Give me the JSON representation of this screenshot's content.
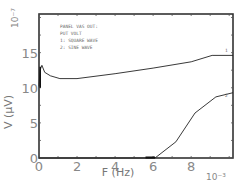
{
  "chart_data": {
    "type": "line",
    "title": "",
    "xlabel": "F (Hz)",
    "ylabel": "V (μV)",
    "x_multiplier": "10⁻³",
    "y_multiplier": "10⁻⁷",
    "xlim": [
      0,
      10.2
    ],
    "ylim": [
      0,
      20.5
    ],
    "x_ticks": [
      "0",
      "2",
      "4",
      "6",
      "8"
    ],
    "y_ticks": [
      "0",
      "5",
      "10",
      "15"
    ],
    "grid": false,
    "legend": {
      "position": "upper-left-inside",
      "lines": [
        "PANEL VAS OUT:",
        "PUT VOLT",
        "1: SQUARE WAVE",
        "2: SINE WAVE"
      ]
    },
    "series": [
      {
        "name": "1: Square wave",
        "label_marker": "1",
        "x": [
          0.0,
          0.05,
          0.15,
          0.3,
          0.6,
          1.1,
          2.0,
          4.0,
          6.0,
          8.0,
          9.1,
          10.2
        ],
        "y": [
          10.2,
          12.5,
          13.2,
          12.2,
          11.7,
          11.3,
          11.3,
          12.0,
          12.8,
          13.7,
          14.6,
          14.6
        ]
      },
      {
        "name": "2: Sine wave",
        "label_marker": "2",
        "x": [
          0.0,
          5.0,
          6.1,
          7.2,
          8.2,
          9.3,
          10.2
        ],
        "y": [
          0.0,
          0.0,
          0.0,
          2.3,
          6.4,
          8.7,
          9.3
        ]
      }
    ]
  }
}
